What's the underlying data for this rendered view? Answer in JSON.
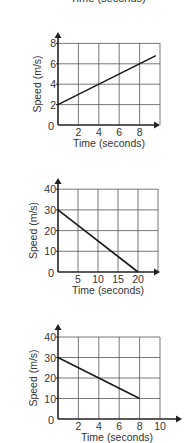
{
  "cut_off_label": "Time (seconds)",
  "chart_data": [
    {
      "type": "line",
      "title": "",
      "xlabel": "Time (seconds)",
      "ylabel": "Speed (m/s)",
      "x_ticks": [
        "0",
        "2",
        "4",
        "6",
        "8"
      ],
      "y_ticks": [
        "2",
        "4",
        "6",
        "8"
      ],
      "xlim": [
        0,
        10
      ],
      "ylim": [
        0,
        8
      ],
      "grid": true,
      "series": [
        {
          "name": "speed",
          "x": [
            0,
            9.6
          ],
          "y": [
            2,
            6.8
          ]
        }
      ]
    },
    {
      "type": "line",
      "title": "",
      "xlabel": "Time (seconds)",
      "ylabel": "Speed (m/s)",
      "x_ticks": [
        "0",
        "5",
        "10",
        "15",
        "20"
      ],
      "y_ticks": [
        "10",
        "20",
        "30",
        "40"
      ],
      "xlim": [
        0,
        25
      ],
      "ylim": [
        0,
        40
      ],
      "grid": true,
      "series": [
        {
          "name": "speed",
          "x": [
            0,
            20
          ],
          "y": [
            30,
            0
          ]
        }
      ]
    },
    {
      "type": "line",
      "title": "",
      "xlabel": "Time (seconds)",
      "ylabel": "Speed (m/s)",
      "x_ticks": [
        "0",
        "2",
        "4",
        "6",
        "8",
        "10"
      ],
      "y_ticks": [
        "10",
        "20",
        "30",
        "40"
      ],
      "xlim": [
        0,
        10
      ],
      "ylim": [
        0,
        40
      ],
      "grid": true,
      "series": [
        {
          "name": "speed",
          "x": [
            0,
            8
          ],
          "y": [
            30,
            10
          ]
        }
      ]
    }
  ]
}
